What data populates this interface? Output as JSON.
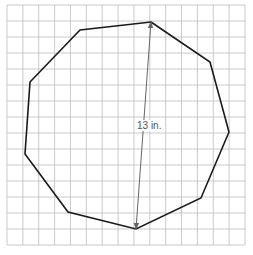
{
  "figure": {
    "type": "nonagon-on-grid",
    "grid": {
      "x0": 7,
      "y0": 5,
      "x1": 245,
      "y1": 245,
      "cols": 15,
      "rows": 15,
      "color": "#bdbdbd"
    },
    "polygon": {
      "sides": 9,
      "stroke": "#1a1a1a",
      "vertices": [
        [
          151,
          22
        ],
        [
          210,
          62
        ],
        [
          229,
          132
        ],
        [
          201,
          198
        ],
        [
          136,
          229
        ],
        [
          68,
          212
        ],
        [
          25,
          154
        ],
        [
          30,
          82
        ],
        [
          80,
          30
        ]
      ]
    },
    "measurement": {
      "from": [
        151,
        22
      ],
      "to": [
        136,
        229
      ],
      "color": "#666666",
      "label": "13 in.",
      "label_pos": [
        137,
        129
      ]
    }
  }
}
